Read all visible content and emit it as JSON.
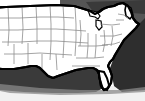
{
  "figure": {
    "name": "united-states-outline-map",
    "title": "Map of the contiguous United States",
    "caption": "",
    "width": 145,
    "height": 101,
    "style": "black and white clip-art outline map with drop shadow",
    "region_label": "Contiguous United States",
    "projection_note": "Alaska and Hawaii not shown"
  },
  "colors": {
    "land_fill": "#ffffff",
    "state_border": "#8d8d8d",
    "outline": "#000000",
    "shadow_dark": "#2b2b2b",
    "shadow_mid": "#6f6f6f",
    "shadow_light": "#bdbdbd",
    "background": "#ffffff",
    "water_dark": "#1a1a1a"
  },
  "features": [
    {
      "id": "canada-border-shadow",
      "label": "Northern border shading",
      "type": "shadow"
    },
    {
      "id": "great-lakes",
      "label": "Great Lakes",
      "type": "water"
    },
    {
      "id": "atlantic-ocean",
      "label": "Atlantic Ocean",
      "type": "water"
    },
    {
      "id": "gulf-of-mexico",
      "label": "Gulf of Mexico",
      "type": "water"
    },
    {
      "id": "florida-peninsula",
      "label": "Florida peninsula",
      "type": "land"
    },
    {
      "id": "texas",
      "label": "Texas",
      "type": "land"
    },
    {
      "id": "michigan",
      "label": "Michigan",
      "type": "land"
    },
    {
      "id": "maine",
      "label": "Maine",
      "type": "land"
    },
    {
      "id": "drop-shadow",
      "label": "Drop shadow beneath map",
      "type": "shadow"
    }
  ],
  "state_lines": {
    "count_visible": 48,
    "stroke_description": "thin light gray internal state boundaries"
  }
}
